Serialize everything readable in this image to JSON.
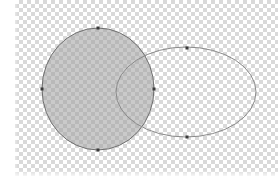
{
  "canvas": {
    "background": "transparent-checkerboard",
    "checker_color": "#d9d9d9",
    "checker_size_px": 4
  },
  "shapes": {
    "circle": {
      "type": "ellipse",
      "cx": 98,
      "cy": 89,
      "rx": 56,
      "ry": 61,
      "fill": "#9e9e9e",
      "fill_opacity": 0.55,
      "stroke": "#6e6e6e",
      "anchor_points": [
        {
          "name": "top",
          "x": 98,
          "y": 28
        },
        {
          "name": "right",
          "x": 154,
          "y": 89
        },
        {
          "name": "bottom",
          "x": 98,
          "y": 150
        },
        {
          "name": "left",
          "x": 42,
          "y": 89
        }
      ]
    },
    "ellipse": {
      "type": "ellipse",
      "cx": 186,
      "cy": 92,
      "rx": 70,
      "ry": 45,
      "fill": "none",
      "stroke": "#8a8a8a",
      "anchor_points": [
        {
          "name": "top",
          "x": 187,
          "y": 48
        },
        {
          "name": "bottom",
          "x": 187,
          "y": 137
        }
      ]
    },
    "anchor_color": "#3a3a3a"
  }
}
